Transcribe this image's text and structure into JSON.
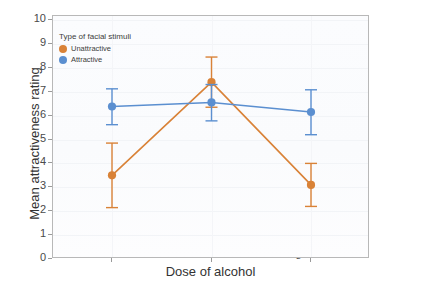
{
  "chart_data": {
    "type": "line",
    "title": "",
    "xlabel": "Dose of alcohol",
    "ylabel": "Mean attractiveness rating",
    "categories": [
      "Placebo",
      "Low dose",
      "High dose"
    ],
    "ylim": [
      0,
      10
    ],
    "yticks": [
      "0",
      "1",
      "2",
      "3",
      "4",
      "5",
      "6",
      "7",
      "8",
      "9",
      "10"
    ],
    "grid": true,
    "legend_position": "top-left inside",
    "legend_title": "Type of facial stimuli",
    "series": [
      {
        "name": "Unattractive",
        "color": "#d98237",
        "values": [
          3.5,
          7.4,
          3.1
        ],
        "ci_low": [
          2.15,
          6.35,
          2.2
        ],
        "ci_high": [
          4.85,
          8.45,
          4.0
        ]
      },
      {
        "name": "Attractive",
        "color": "#5b8fd0",
        "values": [
          6.38,
          6.55,
          6.15
        ],
        "ci_low": [
          5.62,
          5.78,
          5.2
        ],
        "ci_high": [
          7.12,
          7.3,
          7.08
        ]
      }
    ]
  },
  "legend": {
    "title": "Type of facial stimuli",
    "items": [
      {
        "label": "Unattractive",
        "color": "#d98237"
      },
      {
        "label": "Attractive",
        "color": "#5b8fd0"
      }
    ]
  },
  "axes": {
    "y_title": "Mean attractiveness rating",
    "x_title": "Dose of alcohol",
    "y_ticks": [
      "10",
      "9",
      "8",
      "7",
      "6",
      "5",
      "4",
      "3",
      "2",
      "1",
      "0"
    ],
    "x_ticks": [
      "Placebo",
      "Low dose",
      "High dose"
    ]
  }
}
